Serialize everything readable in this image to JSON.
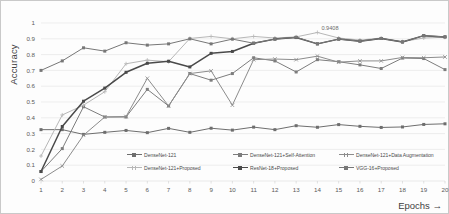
{
  "chart_data": {
    "type": "line",
    "title": "",
    "xlabel": "Epochs →",
    "ylabel": "Accuracy",
    "x": [
      1,
      2,
      3,
      4,
      5,
      6,
      7,
      8,
      9,
      10,
      11,
      12,
      13,
      14,
      15,
      16,
      17,
      18,
      19,
      20
    ],
    "xtick_labels": [
      "1",
      "2",
      "3",
      "4",
      "5",
      "6",
      "7",
      "8",
      "9",
      "10",
      "11",
      "12",
      "13",
      "14",
      "15",
      "16",
      "17",
      "18",
      "19",
      "20"
    ],
    "ytick_labels": [
      "0",
      "0.1",
      "0.2",
      "0.3",
      "0.4",
      "0.5",
      "0.6",
      "0.7",
      "0.8",
      "0.9",
      "1"
    ],
    "ylim": [
      0,
      1
    ],
    "xlim": [
      1,
      20
    ],
    "grid": "horizontal",
    "legend_position": "inside-bottom",
    "annotations": [
      {
        "text": "0.9408",
        "x": 14,
        "y": 0.9408
      }
    ],
    "series": [
      {
        "name": "DenseNet-121",
        "color": "#6e6e6e",
        "marker": "square",
        "values": [
          0.325,
          0.325,
          0.295,
          0.308,
          0.32,
          0.306,
          0.333,
          0.308,
          0.334,
          0.322,
          0.341,
          0.325,
          0.35,
          0.34,
          0.357,
          0.346,
          0.339,
          0.342,
          0.358,
          0.362
        ]
      },
      {
        "name": "DenseNet-121+Self-Attention",
        "color": "#7d7d7d",
        "marker": "square",
        "values": [
          0.06,
          0.205,
          0.47,
          0.405,
          0.405,
          0.58,
          0.475,
          0.68,
          0.638,
          0.68,
          0.78,
          0.76,
          0.69,
          0.768,
          0.755,
          0.735,
          0.712,
          0.778,
          0.775,
          0.705
        ]
      },
      {
        "name": "DenseNet-121+Data Augmentation",
        "color": "#8c8c8c",
        "marker": "cross",
        "values": [
          0.01,
          0.095,
          0.29,
          0.405,
          0.408,
          0.65,
          0.475,
          0.68,
          0.697,
          0.48,
          0.768,
          0.772,
          0.768,
          0.79,
          0.752,
          0.76,
          0.76,
          0.782,
          0.78,
          0.785
        ]
      },
      {
        "name": "DenseNet-121+Proposed",
        "color": "#b7b7b7",
        "marker": "plus",
        "values": [
          0.158,
          0.418,
          0.48,
          0.565,
          0.742,
          0.765,
          0.755,
          0.902,
          0.915,
          0.9,
          0.915,
          0.905,
          0.912,
          0.94,
          0.905,
          0.892,
          0.905,
          0.882,
          0.905,
          0.91
        ]
      },
      {
        "name": "ResNet-18+Proposed",
        "color": "#4a4a4a",
        "marker": "square",
        "values": [
          0.06,
          0.345,
          0.505,
          0.588,
          0.688,
          0.745,
          0.758,
          0.722,
          0.808,
          0.82,
          0.872,
          0.898,
          0.908,
          0.868,
          0.898,
          0.885,
          0.902,
          0.88,
          0.92,
          0.912
        ]
      },
      {
        "name": "VGG-16+Proposed",
        "color": "#777777",
        "marker": "square",
        "values": [
          0.7,
          0.76,
          0.843,
          0.822,
          0.875,
          0.86,
          0.868,
          0.9,
          0.868,
          0.898,
          0.872,
          0.898,
          0.91,
          0.868,
          0.898,
          0.885,
          0.902,
          0.88,
          0.92,
          0.912
        ]
      }
    ]
  },
  "axis": {
    "y_title": "Accuracy",
    "x_title": "Epochs →"
  },
  "legend": {
    "items": [
      {
        "label": "DenseNet-121"
      },
      {
        "label": "DenseNet-121+Self-Attention"
      },
      {
        "label": "DenseNet-121+Data Augmentation"
      },
      {
        "label": "DenseNet-121+Proposed"
      },
      {
        "label": "ResNet-18+Proposed"
      },
      {
        "label": "VGG-16+Proposed"
      }
    ]
  }
}
